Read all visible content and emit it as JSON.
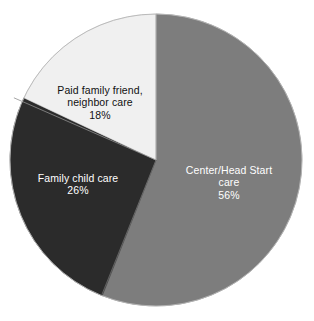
{
  "chart_data": {
    "type": "pie",
    "title": "",
    "subtitle": "",
    "xlabel": "",
    "ylabel": "",
    "legend_position": "none",
    "grid": false,
    "labels_inside": true,
    "start_angle_deg": 0,
    "direction": "clockwise",
    "categories": [
      "Center/Head Start care",
      "Family child care",
      "Paid family friend, neighbor care"
    ],
    "values": [
      56,
      26,
      18
    ],
    "value_unit": "%",
    "colors": [
      "#7d7d7d",
      "#2b2b2b",
      "#f0f0f0"
    ],
    "slices": [
      {
        "name": "Center/Head Start care",
        "label_line1": "Center/Head Start",
        "label_line2": "care",
        "value": 56,
        "value_text": "56%",
        "color": "#7d7d7d",
        "text_color": "#ffffff"
      },
      {
        "name": "Family child care",
        "label_line1": "Family child care",
        "label_line2": "",
        "value": 26,
        "value_text": "26%",
        "color": "#2b2b2b",
        "text_color": "#ffffff"
      },
      {
        "name": "Paid family friend, neighbor care",
        "label_line1": "Paid family friend,",
        "label_line2": "neighbor care",
        "value": 18,
        "value_text": "18%",
        "color": "#f0f0f0",
        "text_color": "#101010"
      }
    ]
  },
  "figure": {
    "background_color": "#ffffff",
    "separator_color": "#9a9a9a",
    "outline_color": "#b5b5b5"
  }
}
